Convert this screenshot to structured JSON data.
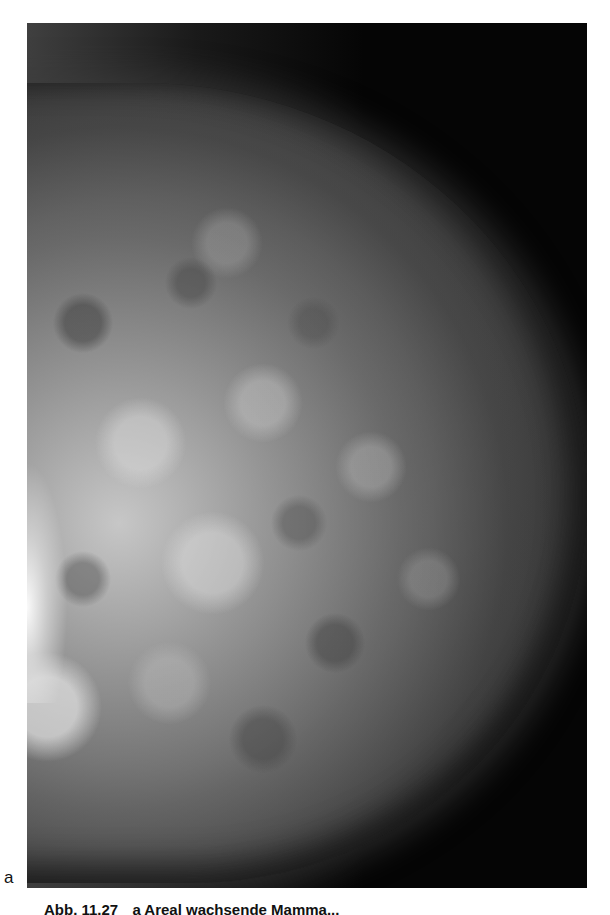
{
  "figure": {
    "type": "mammogram",
    "view": "mediolateral oblique",
    "panel_label": "a"
  },
  "caption": {
    "figure_number": "Abb. 11.27",
    "text": "a Areal wachsende Mamma...",
    "truncated": true
  },
  "colors": {
    "background": "#ffffff",
    "image_background": "#050505",
    "text": "#111111"
  }
}
